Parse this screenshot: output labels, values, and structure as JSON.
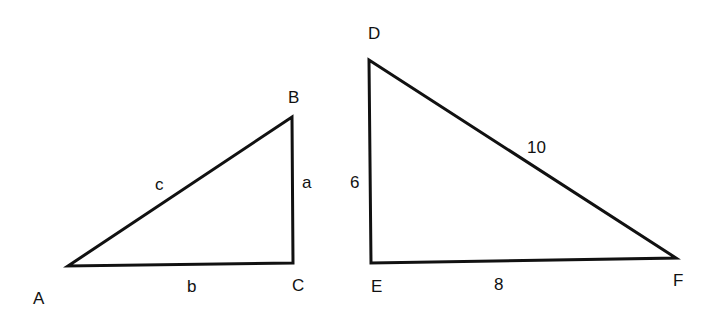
{
  "diagram": {
    "triangle_abc": {
      "vertices": {
        "A": "A",
        "B": "B",
        "C": "C"
      },
      "sides": {
        "a": "a",
        "b": "b",
        "c": "c"
      }
    },
    "triangle_def": {
      "vertices": {
        "D": "D",
        "E": "E",
        "F": "F"
      },
      "sides": {
        "DE": "6",
        "EF": "8",
        "DF": "10"
      }
    },
    "stroke_color": "#111111"
  }
}
